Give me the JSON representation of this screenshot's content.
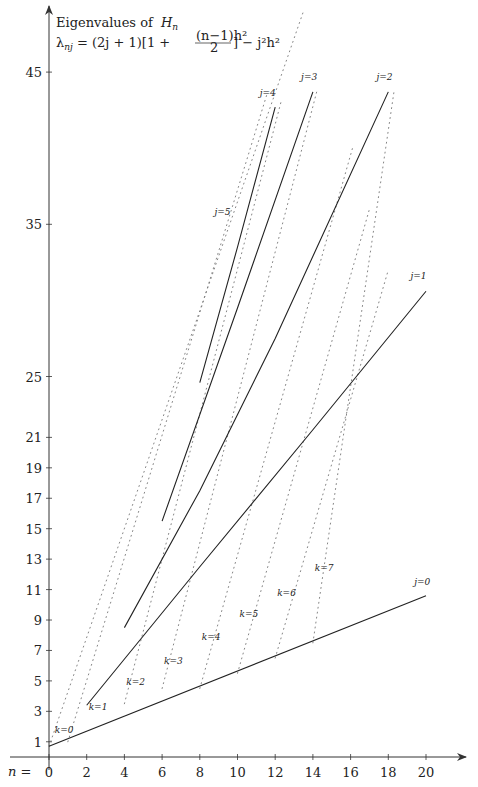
{
  "chart_data": {
    "type": "line",
    "subtitle": "λ_nj = (2j+1)[1 + (n−1)h²/2] − j²h²",
    "xlabel": "n =",
    "ylabel": "",
    "x_ticks": [
      0,
      2,
      4,
      6,
      8,
      10,
      12,
      14,
      16,
      18,
      20
    ],
    "y_ticks": [
      1,
      3,
      5,
      7,
      9,
      11,
      13,
      15,
      17,
      19,
      21,
      25,
      35,
      45
    ],
    "xlim": [
      0,
      21
    ],
    "ylim": [
      0,
      50
    ],
    "grid": false,
    "legend": null,
    "series": [
      {
        "name": "j=0",
        "style": "solid",
        "x": [
          0,
          20
        ],
        "values": [
          0.7,
          10.6
        ]
      },
      {
        "name": "j=1",
        "style": "solid",
        "x": [
          2,
          8,
          14,
          20
        ],
        "values": [
          3.4,
          12.5,
          21.5,
          30.6
        ]
      },
      {
        "name": "j=2",
        "style": "solid",
        "x": [
          4,
          8,
          12,
          18
        ],
        "values": [
          8.5,
          17.5,
          27.5,
          43.7
        ]
      },
      {
        "name": "j=3",
        "style": "solid",
        "x": [
          6,
          10,
          14
        ],
        "values": [
          15.5,
          29.5,
          43.7
        ]
      },
      {
        "name": "j=4",
        "style": "solid",
        "x": [
          8,
          10,
          12
        ],
        "values": [
          24.6,
          33.5,
          42.7
        ]
      },
      {
        "name": "j=5",
        "style": "solid",
        "x": [],
        "values": []
      }
    ],
    "k_lines": [
      {
        "name": "k=0",
        "style": "dotted",
        "x": [
          0,
          13.5
        ],
        "values": [
          0.7,
          49
        ]
      },
      {
        "name": "k=1",
        "style": "dotted",
        "x": [
          1,
          11.6
        ],
        "values": [
          1,
          43.7
        ]
      },
      {
        "name": "k=2",
        "style": "dotted",
        "x": [
          4,
          12.3
        ],
        "values": [
          3.5,
          43
        ]
      },
      {
        "name": "k=3",
        "style": "dotted",
        "x": [
          6,
          14.2
        ],
        "values": [
          4.5,
          43.7
        ]
      },
      {
        "name": "k=4",
        "style": "dotted",
        "x": [
          8,
          16.1
        ],
        "values": [
          4.5,
          40
        ]
      },
      {
        "name": "k=5",
        "style": "dotted",
        "x": [
          10,
          17
        ],
        "values": [
          5.5,
          36
        ]
      },
      {
        "name": "k=6",
        "style": "dotted",
        "x": [
          12,
          18
        ],
        "values": [
          6.5,
          32
        ]
      },
      {
        "name": "k=7",
        "style": "dotted",
        "x": [
          14,
          18.3
        ],
        "values": [
          7.5,
          43.7
        ]
      }
    ],
    "annotations": [
      {
        "text": "j=0",
        "x": 19.8,
        "y": 11.3
      },
      {
        "text": "j=1",
        "x": 19.6,
        "y": 31.4
      },
      {
        "text": "j=2",
        "x": 17.8,
        "y": 44.5
      },
      {
        "text": "j=3",
        "x": 13.8,
        "y": 44.5
      },
      {
        "text": "j=4",
        "x": 11.6,
        "y": 43.4
      },
      {
        "text": "j=5",
        "x": 9.2,
        "y": 35.6
      },
      {
        "text": "k=0",
        "x": 0.8,
        "y": 1.6
      },
      {
        "text": "k=1",
        "x": 2.6,
        "y": 3.1
      },
      {
        "text": "k=2",
        "x": 4.6,
        "y": 4.7
      },
      {
        "text": "k=3",
        "x": 6.6,
        "y": 6.1
      },
      {
        "text": "k=4",
        "x": 8.6,
        "y": 7.7
      },
      {
        "text": "k=5",
        "x": 10.6,
        "y": 9.2
      },
      {
        "text": "k=6",
        "x": 12.6,
        "y": 10.6
      },
      {
        "text": "k=7",
        "x": 14.6,
        "y": 12.2
      }
    ]
  },
  "labels": {
    "title_line1": "Eigenvalues of",
    "title_var": "H",
    "title_sub": "n",
    "formula_lhs": "λ",
    "formula_lhs_sub": "nj",
    "formula_rhs_a": " = (2j + 1)[1 + ",
    "formula_num": "(n−1)h²",
    "formula_den": "2",
    "formula_rhs_b": "] − j²h²",
    "x_axis_prefix": "n ="
  }
}
